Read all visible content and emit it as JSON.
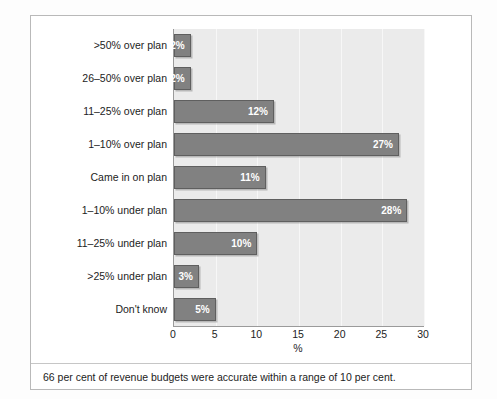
{
  "chart_data": {
    "type": "bar",
    "orientation": "horizontal",
    "title": "",
    "subtitle": "",
    "xlabel": "%",
    "ylabel": "",
    "xlim": [
      0,
      30
    ],
    "xticks": [
      0,
      5,
      10,
      15,
      20,
      25,
      30
    ],
    "xtick_labels": [
      "0",
      "5",
      "10",
      "15",
      "20",
      "25",
      "30"
    ],
    "grid": true,
    "grid_axis": "x",
    "legend": false,
    "legend_position": "none",
    "categories": [
      ">50% over plan",
      "26–50% over plan",
      "11–25% over plan",
      "1–10% over plan",
      "Came in on plan",
      "1–10% under plan",
      "11–25% under plan",
      ">25% under plan",
      "Don't know"
    ],
    "values": [
      2,
      2,
      12,
      27,
      11,
      28,
      10,
      3,
      5
    ],
    "value_labels": [
      "2%",
      "2%",
      "12%",
      "27%",
      "11%",
      "28%",
      "10%",
      "3%",
      "5%"
    ],
    "colors": {
      "bar_fill": "#818181",
      "bar_border": "#5f5f5f",
      "plot_background": "#ebebeb",
      "gridline": "#f7f7f7",
      "axis": "#9a9a9a",
      "value_label_text": "#ffffff",
      "text": "#1c1c1c",
      "frame_border": "#b9b9b9",
      "page_background": "#fdfdfd"
    }
  },
  "footnote": {
    "text": "66 per cent of revenue budgets were accurate within a range of 10 per cent."
  }
}
